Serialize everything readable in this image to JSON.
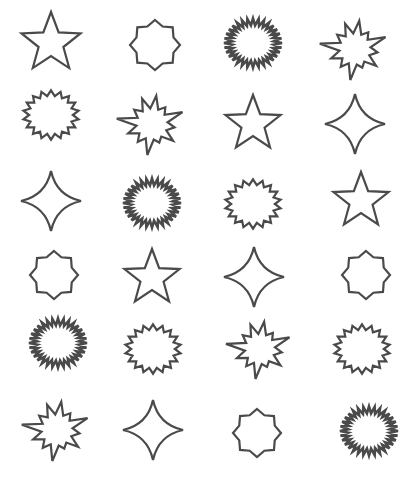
{
  "sheet": {
    "title": "Star and burst shapes grid",
    "stroke_color": "#4a4a4a",
    "background": "#ffffff",
    "columns": 4,
    "rows": 6
  },
  "shapes": [
    {
      "type": "star5",
      "cx": 51,
      "cy": 43,
      "r": 31
    },
    {
      "type": "octagram",
      "cx": 155,
      "cy": 45,
      "r": 25
    },
    {
      "type": "dense-seal",
      "cx": 253,
      "cy": 43,
      "r": 29
    },
    {
      "type": "burst",
      "cx": 355,
      "cy": 49,
      "r": 30
    },
    {
      "type": "seal",
      "cx": 51,
      "cy": 115,
      "r": 28
    },
    {
      "type": "burst",
      "cx": 152,
      "cy": 124,
      "r": 30
    },
    {
      "type": "star5",
      "cx": 253,
      "cy": 124,
      "r": 29
    },
    {
      "type": "sparkle4",
      "cx": 355,
      "cy": 124,
      "r": 30
    },
    {
      "type": "sparkle4",
      "cx": 51,
      "cy": 201,
      "r": 30
    },
    {
      "type": "dense-seal",
      "cx": 152,
      "cy": 203,
      "r": 29
    },
    {
      "type": "seal",
      "cx": 253,
      "cy": 204,
      "r": 28
    },
    {
      "type": "star5",
      "cx": 361,
      "cy": 201,
      "r": 29
    },
    {
      "type": "octagram",
      "cx": 54,
      "cy": 275,
      "r": 24
    },
    {
      "type": "star5",
      "cx": 152,
      "cy": 278,
      "r": 29
    },
    {
      "type": "sparkle4",
      "cx": 254,
      "cy": 277,
      "r": 30
    },
    {
      "type": "octagram",
      "cx": 366,
      "cy": 275,
      "r": 24
    },
    {
      "type": "dense-seal",
      "cx": 58,
      "cy": 343,
      "r": 29
    },
    {
      "type": "seal",
      "cx": 153,
      "cy": 349,
      "r": 28
    },
    {
      "type": "burst",
      "cx": 260,
      "cy": 349,
      "r": 29
    },
    {
      "type": "seal",
      "cx": 362,
      "cy": 349,
      "r": 28
    },
    {
      "type": "burst",
      "cx": 57,
      "cy": 430,
      "r": 30
    },
    {
      "type": "sparkle4",
      "cx": 153,
      "cy": 430,
      "r": 30
    },
    {
      "type": "octagram",
      "cx": 257,
      "cy": 433,
      "r": 24
    },
    {
      "type": "dense-seal",
      "cx": 369,
      "cy": 431,
      "r": 29
    }
  ]
}
